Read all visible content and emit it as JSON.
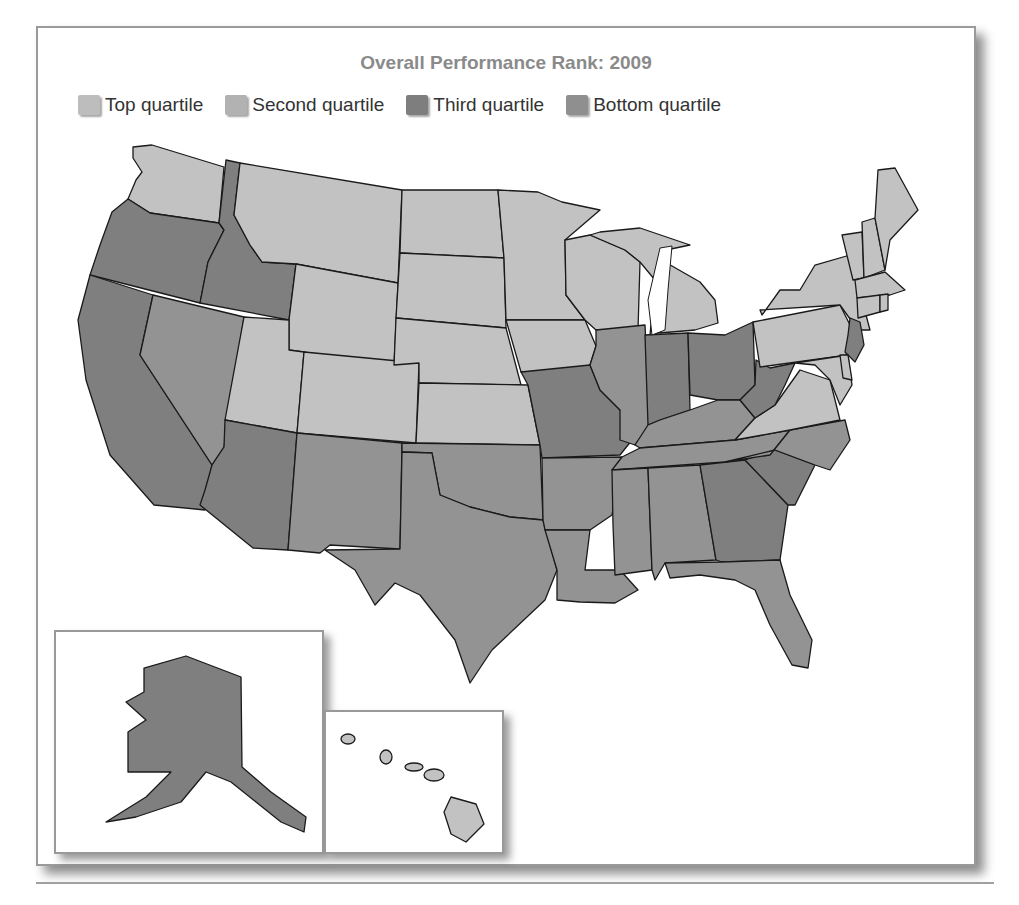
{
  "title": "Overall Performance Rank: 2009",
  "legend": [
    {
      "label": "Top quartile",
      "color": "#bdbdbd"
    },
    {
      "label": "Second quartile",
      "color": "#b2b2b2"
    },
    {
      "label": "Third quartile",
      "color": "#7e7e7e"
    },
    {
      "label": "Bottom quartile",
      "color": "#8f8f8f"
    }
  ],
  "colors": {
    "top": "#c2c2c2",
    "second": "#b6b6b6",
    "third": "#7f7f7f",
    "bottom": "#939393"
  },
  "states": {
    "WA": "top",
    "OR": "third",
    "ID": "third",
    "MT": "top",
    "WY": "top",
    "ND": "top",
    "SD": "top",
    "NE": "top",
    "KS": "top",
    "MN": "top",
    "IA": "top",
    "WI": "top",
    "MI": "top",
    "UT": "top",
    "CO": "top",
    "CA": "third",
    "NV": "bottom",
    "AZ": "third",
    "NM": "bottom",
    "TX": "bottom",
    "OK": "bottom",
    "MO": "third",
    "AR": "bottom",
    "LA": "bottom",
    "IL": "bottom",
    "IN": "third",
    "OH": "third",
    "KY": "bottom",
    "TN": "bottom",
    "MS": "bottom",
    "AL": "bottom",
    "GA": "third",
    "FL": "bottom",
    "SC": "third",
    "NC": "bottom",
    "VA": "top",
    "WV": "third",
    "PA": "top",
    "NY": "top",
    "NJ": "third",
    "DE": "top",
    "MD": "top",
    "CT": "top",
    "RI": "top",
    "MA": "top",
    "VT": "top",
    "NH": "top",
    "ME": "top",
    "AK": "third",
    "HI": "top"
  }
}
